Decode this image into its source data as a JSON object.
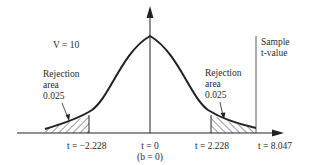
{
  "diagram": {
    "type": "t-distribution two-tailed test",
    "degrees_of_freedom_label": "V = 10",
    "left_rejection": {
      "label_line1": "Rejection",
      "label_line2": "area",
      "label_line3": "0.025",
      "critical_value_label": "t = −2.228"
    },
    "right_rejection": {
      "label_line1": "Rejection",
      "label_line2": "area",
      "label_line3": "0.025",
      "critical_value_label": "t = 2.228"
    },
    "center": {
      "label_line1": "t = 0",
      "label_line2": "(b = 0)"
    },
    "sample": {
      "label_line1": "Sample",
      "label_line2": "t-value",
      "value_label": "t = 8.047"
    },
    "colors": {
      "ink": "#222222",
      "background": "#ffffff"
    }
  }
}
